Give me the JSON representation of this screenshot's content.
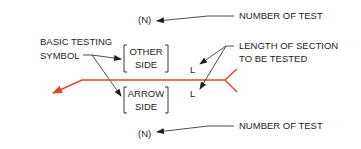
{
  "diagram": {
    "labels": {
      "number_of_test_top": "NUMBER OF TEST",
      "number_of_test_bottom": "NUMBER OF TEST",
      "basic_testing_symbol_line1": "BASIC TESTING",
      "basic_testing_symbol_line2": "SYMBOL",
      "length_of_section_line1": "LENGTH OF SECTION",
      "length_of_section_line2": "TO BE TESTED"
    },
    "symbol": {
      "n_top": "(N)",
      "n_bottom": "(N)",
      "other_side_line1": "OTHER",
      "other_side_line2": "SIDE",
      "arrow_side_line1": "ARROW",
      "arrow_side_line2": "SIDE",
      "l_top": "L",
      "l_bottom": "L"
    },
    "colors": {
      "reference_line": "#e2462a",
      "text": "#231f20",
      "background": "#ffffff"
    }
  }
}
